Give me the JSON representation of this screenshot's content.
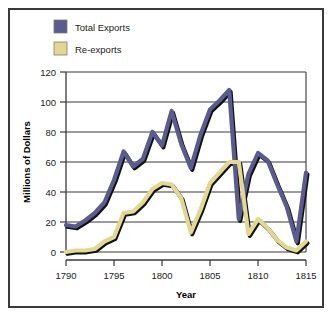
{
  "chart_data": {
    "type": "line",
    "title": "",
    "xlabel": "Year",
    "ylabel": "Millions of Dollars",
    "xlim": [
      1790,
      1815
    ],
    "ylim": [
      0,
      120
    ],
    "xticks": [
      "1790",
      "1795",
      "1800",
      "1805",
      "1810",
      "1815"
    ],
    "yticks": [
      "0",
      "20",
      "40",
      "60",
      "80",
      "100",
      "120"
    ],
    "grid": "horizontal",
    "legend_position": "top-left",
    "x": [
      1790,
      1791,
      1792,
      1793,
      1794,
      1795,
      1796,
      1797,
      1798,
      1799,
      1800,
      1801,
      1802,
      1803,
      1804,
      1805,
      1806,
      1807,
      1808,
      1809,
      1810,
      1811,
      1812,
      1813,
      1814,
      1815
    ],
    "series": [
      {
        "name": "Total Exports",
        "color": "#5b5b8f",
        "values": [
          18,
          17,
          21,
          26,
          33,
          48,
          67,
          57,
          62,
          80,
          71,
          94,
          72,
          56,
          78,
          95,
          101,
          108,
          22,
          52,
          66,
          61,
          45,
          30,
          7,
          53
        ]
      },
      {
        "name": "Re-exports",
        "color": "#e3d892",
        "values": [
          0,
          1,
          1,
          2,
          7,
          10,
          26,
          27,
          33,
          42,
          46,
          45,
          36,
          13,
          28,
          46,
          53,
          60,
          60,
          12,
          22,
          16,
          8,
          3,
          1,
          7
        ]
      }
    ]
  },
  "legend": {
    "items": [
      {
        "label": "Total Exports",
        "color": "#5b5b8f"
      },
      {
        "label": "Re-exports",
        "color": "#e3d892"
      }
    ]
  },
  "axes": {
    "y_title": "Millions of Dollars",
    "x_title": "Year",
    "y_ticks": [
      "120",
      "100",
      "80",
      "60",
      "40",
      "20",
      "0"
    ],
    "x_ticks": [
      "1790",
      "1795",
      "1800",
      "1805",
      "1810",
      "1815"
    ]
  }
}
